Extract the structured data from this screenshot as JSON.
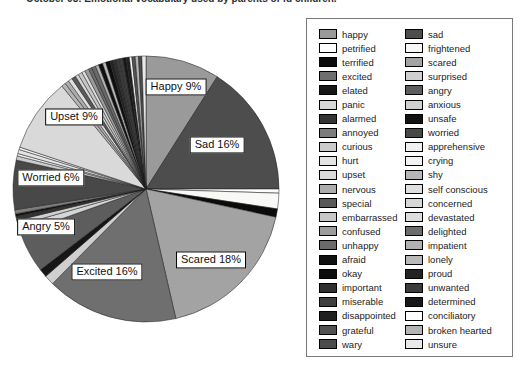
{
  "caption": "October 08: Emotional vocabulary used by parents of fd children.",
  "colors": {
    "background": "#ffffff",
    "outline": "#1c1c1c",
    "legend_border": "#7a7a7a"
  },
  "chart_data": {
    "type": "pie",
    "title": "Emotional vocabulary used by parents",
    "legend_position": "right",
    "start_angle_deg": 0,
    "direction": "clockwise",
    "slices": [
      {
        "label": "happy",
        "value": 9,
        "color": "#9a9a9a"
      },
      {
        "label": "sad",
        "value": 16,
        "color": "#4d4d4d"
      },
      {
        "label": "petrified",
        "value": 0.5,
        "color": "#fdfdfd"
      },
      {
        "label": "frightened",
        "value": 1.9,
        "color": "#f8f8f6"
      },
      {
        "label": "terrified",
        "value": 1.0,
        "color": "#0b0b0b"
      },
      {
        "label": "scared",
        "value": 18,
        "color": "#a3a3a3"
      },
      {
        "label": "excited",
        "value": 16,
        "color": "#6f6f6f"
      },
      {
        "label": "surprised",
        "value": 1.2,
        "color": "#cfcfcf"
      },
      {
        "label": "elated",
        "value": 1.0,
        "color": "#161616"
      },
      {
        "label": "angry",
        "value": 5,
        "color": "#5d5d5d"
      },
      {
        "label": "panic",
        "value": 1.0,
        "color": "#d6d6d6"
      },
      {
        "label": "anxious",
        "value": 0.6,
        "color": "#d0d0d0"
      },
      {
        "label": "alarmed",
        "value": 0.5,
        "color": "#343434"
      },
      {
        "label": "unsafe",
        "value": 0.3,
        "color": "#121212"
      },
      {
        "label": "annoyed",
        "value": 0.5,
        "color": "#7d7d7d"
      },
      {
        "label": "worried",
        "value": 6,
        "color": "#484848"
      },
      {
        "label": "curious",
        "value": 0.5,
        "color": "#cbcbcb"
      },
      {
        "label": "apprehensive",
        "value": 0.3,
        "color": "#f0f0f0"
      },
      {
        "label": "hurt",
        "value": 0.5,
        "color": "#e4e4e4"
      },
      {
        "label": "crying",
        "value": 0.3,
        "color": "#f3f3f3"
      },
      {
        "label": "upset",
        "value": 9,
        "color": "#d9d9d9"
      },
      {
        "label": "shy",
        "value": 0.5,
        "color": "#b6b6b6"
      },
      {
        "label": "nervous",
        "value": 0.5,
        "color": "#acacac"
      },
      {
        "label": "self conscious",
        "value": 0.5,
        "color": "#dfdfdf"
      },
      {
        "label": "special",
        "value": 0.5,
        "color": "#595959"
      },
      {
        "label": "concerned",
        "value": 0.4,
        "color": "#d7d7d7"
      },
      {
        "label": "embarrassed",
        "value": 0.5,
        "color": "#c7c7c7"
      },
      {
        "label": "devastated",
        "value": 0.4,
        "color": "#dddddd"
      },
      {
        "label": "confused",
        "value": 0.5,
        "color": "#9c9c9c"
      },
      {
        "label": "delighted",
        "value": 0.4,
        "color": "#6c6c6c"
      },
      {
        "label": "unhappy",
        "value": 0.5,
        "color": "#6a6a6a"
      },
      {
        "label": "impatient",
        "value": 0.4,
        "color": "#b1b1b1"
      },
      {
        "label": "afraid",
        "value": 0.5,
        "color": "#101010"
      },
      {
        "label": "lonely",
        "value": 0.4,
        "color": "#b9b9b9"
      },
      {
        "label": "okay",
        "value": 0.5,
        "color": "#0d0d0d"
      },
      {
        "label": "proud",
        "value": 0.4,
        "color": "#232323"
      },
      {
        "label": "important",
        "value": 0.4,
        "color": "#2f2f2f"
      },
      {
        "label": "unwanted",
        "value": 0.4,
        "color": "#3b3b3b"
      },
      {
        "label": "miserable",
        "value": 0.4,
        "color": "#3e3e3e"
      },
      {
        "label": "determined",
        "value": 0.4,
        "color": "#171717"
      },
      {
        "label": "disappointed",
        "value": 0.4,
        "color": "#202020"
      },
      {
        "label": "conciliatory",
        "value": 0.3,
        "color": "#fefefe"
      },
      {
        "label": "grateful",
        "value": 0.4,
        "color": "#515151"
      },
      {
        "label": "broken hearted",
        "value": 0.4,
        "color": "#b4b4b4"
      },
      {
        "label": "wary",
        "value": 0.4,
        "color": "#4b4b4b"
      },
      {
        "label": "unsure",
        "value": 0.5,
        "color": "#e9e9e9"
      }
    ],
    "callouts": [
      {
        "text": "Happy 9%",
        "x": 176,
        "y": 87
      },
      {
        "text": "Sad 16%",
        "x": 217,
        "y": 145
      },
      {
        "text": "Scared 18%",
        "x": 211,
        "y": 260
      },
      {
        "text": "Excited 16%",
        "x": 107,
        "y": 272
      },
      {
        "text": "Angry 5%",
        "x": 46,
        "y": 227
      },
      {
        "text": "Worried 6%",
        "x": 51,
        "y": 178
      },
      {
        "text": "Upset 9%",
        "x": 74,
        "y": 117
      }
    ]
  }
}
